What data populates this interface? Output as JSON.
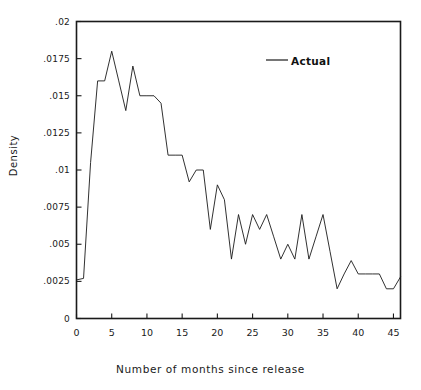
{
  "chart_data": {
    "type": "line",
    "title": "",
    "xlabel": "Number of months since release",
    "ylabel": "Density",
    "xlim": [
      0,
      46
    ],
    "ylim": [
      0,
      0.02
    ],
    "grid": false,
    "legend_position": "top-right",
    "x_ticks": [
      "0",
      "5",
      "10",
      "15",
      "20",
      "25",
      "30",
      "35",
      "40",
      "45"
    ],
    "x_tick_values": [
      0,
      5,
      10,
      15,
      20,
      25,
      30,
      35,
      40,
      45
    ],
    "y_ticks": [
      "0",
      ".0025",
      ".005",
      ".0075",
      ".01",
      ".0125",
      ".015",
      ".0175",
      ".02"
    ],
    "y_tick_values": [
      0,
      0.0025,
      0.005,
      0.0075,
      0.01,
      0.0125,
      0.015,
      0.0175,
      0.02
    ],
    "series": [
      {
        "name": "Actual",
        "color": "#1a1a1a",
        "x": [
          0,
          1,
          2,
          3,
          4,
          5,
          6,
          7,
          8,
          9,
          10,
          11,
          12,
          13,
          14,
          15,
          16,
          17,
          18,
          19,
          20,
          21,
          22,
          23,
          24,
          25,
          26,
          27,
          28,
          29,
          30,
          31,
          32,
          33,
          34,
          35,
          36,
          37,
          38,
          39,
          40,
          41,
          42,
          43,
          44,
          45,
          46
        ],
        "values": [
          0.0026,
          0.0027,
          0.0105,
          0.016,
          0.016,
          0.018,
          0.016,
          0.014,
          0.017,
          0.015,
          0.015,
          0.015,
          0.0145,
          0.011,
          0.011,
          0.011,
          0.0092,
          0.01,
          0.01,
          0.006,
          0.009,
          0.008,
          0.004,
          0.007,
          0.005,
          0.007,
          0.006,
          0.007,
          0.0055,
          0.004,
          0.005,
          0.004,
          0.007,
          0.004,
          0.0055,
          0.007,
          0.0045,
          0.002,
          0.003,
          0.0039,
          0.003,
          0.003,
          0.003,
          0.003,
          0.002,
          0.002,
          0.0028
        ]
      }
    ]
  },
  "legend": {
    "entries": [
      {
        "label": "Actual",
        "color": "#1a1a1a"
      }
    ]
  },
  "axes": {
    "x_label": "Number of months since release",
    "y_label": "Density"
  }
}
